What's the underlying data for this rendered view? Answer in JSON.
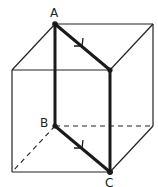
{
  "diagram": {
    "type": "cube-with-path",
    "labels": {
      "A": "A",
      "B": "B",
      "C": "C"
    },
    "colors": {
      "edge": "#222222",
      "highlight": "#1a1a1a",
      "background": "#ffffff"
    },
    "highlighted_path": [
      "A",
      "B",
      "C",
      "top-right-front",
      "A"
    ],
    "arrows_on": [
      "A→top-right-front",
      "B→C"
    ],
    "hidden_edges_dashed": true
  }
}
